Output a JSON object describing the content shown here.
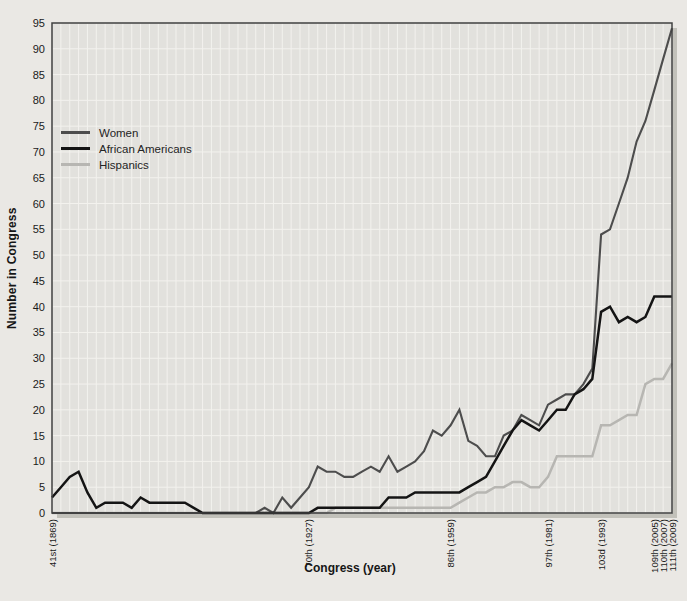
{
  "figure": {
    "y_axis_title": "Number in Congress",
    "x_axis_title": "Congress (year)"
  },
  "legend": {
    "position": "upper-left-inside",
    "items": [
      {
        "label": "Women",
        "color": "#4d4d4d"
      },
      {
        "label": "African Americans",
        "color": "#141414"
      },
      {
        "label": "Hispanics",
        "color": "#b7b6b2"
      }
    ]
  },
  "colors": {
    "paper_background": "#eae8e4",
    "plot_background": "#e2e1dd",
    "gridline": "#f3f2ee",
    "frame": "#3f3f3f",
    "shadow": "#c2c1ba",
    "tick_text": "#1a1a1a"
  },
  "chart_data": {
    "type": "line",
    "title": "",
    "xlabel": "Congress (year)",
    "ylabel": "Number in Congress",
    "grid": true,
    "legend_position": "upper-left-inside",
    "ylim": [
      0,
      95
    ],
    "y_tick_step": 5,
    "y_ticks": [
      0,
      5,
      10,
      15,
      20,
      25,
      30,
      35,
      40,
      45,
      50,
      55,
      60,
      65,
      70,
      75,
      80,
      85,
      90,
      95
    ],
    "x_unit": "Congress number (one data point per Congress)",
    "x_range": [
      41,
      111
    ],
    "x_step": 1,
    "x": [
      41,
      42,
      43,
      44,
      45,
      46,
      47,
      48,
      49,
      50,
      51,
      52,
      53,
      54,
      55,
      56,
      57,
      58,
      59,
      60,
      61,
      62,
      63,
      64,
      65,
      66,
      67,
      68,
      69,
      70,
      71,
      72,
      73,
      74,
      75,
      76,
      77,
      78,
      79,
      80,
      81,
      82,
      83,
      84,
      85,
      86,
      87,
      88,
      89,
      90,
      91,
      92,
      93,
      94,
      95,
      96,
      97,
      98,
      99,
      100,
      101,
      102,
      103,
      104,
      105,
      106,
      107,
      108,
      109,
      110,
      111
    ],
    "x_tick_labels": [
      {
        "congress": 41,
        "label": "41st (1869)"
      },
      {
        "congress": 70,
        "label": "70th (1927)"
      },
      {
        "congress": 86,
        "label": "86th (1959)"
      },
      {
        "congress": 97,
        "label": "97th (1981)"
      },
      {
        "congress": 103,
        "label": "103d (1993)"
      },
      {
        "congress": 109,
        "label": "109th (2005)"
      },
      {
        "congress": 110,
        "label": "110th (2007)"
      },
      {
        "congress": 111,
        "label": "111th (2009)"
      }
    ],
    "series": [
      {
        "name": "Women",
        "color": "#4d4d4d",
        "stroke_width": 2.1,
        "values": [
          0,
          0,
          0,
          0,
          0,
          0,
          0,
          0,
          0,
          0,
          0,
          0,
          0,
          0,
          0,
          0,
          0,
          0,
          0,
          0,
          0,
          0,
          0,
          0,
          1,
          0,
          3,
          1,
          3,
          5,
          9,
          8,
          8,
          7,
          7,
          8,
          9,
          8,
          11,
          8,
          9,
          10,
          12,
          16,
          15,
          17,
          20,
          14,
          13,
          11,
          11,
          15,
          16,
          19,
          18,
          17,
          21,
          22,
          23,
          23,
          25,
          28,
          54,
          55,
          60,
          65,
          72,
          76,
          82,
          88,
          94
        ]
      },
      {
        "name": "African Americans",
        "color": "#141414",
        "stroke_width": 2.5,
        "values": [
          3,
          5,
          7,
          8,
          4,
          1,
          2,
          2,
          2,
          1,
          3,
          2,
          2,
          2,
          2,
          2,
          1,
          0,
          0,
          0,
          0,
          0,
          0,
          0,
          0,
          0,
          0,
          0,
          0,
          0,
          1,
          1,
          1,
          1,
          1,
          1,
          1,
          1,
          3,
          3,
          3,
          4,
          4,
          4,
          4,
          4,
          4,
          5,
          6,
          7,
          10,
          13,
          16,
          18,
          17,
          16,
          18,
          20,
          20,
          23,
          24,
          26,
          39,
          40,
          37,
          38,
          37,
          38,
          42,
          42,
          42
        ]
      },
      {
        "name": "Hispanics",
        "color": "#b7b6b2",
        "stroke_width": 2.5,
        "values": [
          0,
          0,
          0,
          0,
          0,
          0,
          0,
          0,
          0,
          0,
          0,
          0,
          0,
          0,
          0,
          0,
          0,
          0,
          0,
          0,
          0,
          0,
          0,
          0,
          0,
          0,
          0,
          0,
          0,
          0,
          0,
          0,
          1,
          1,
          1,
          1,
          1,
          1,
          1,
          1,
          1,
          1,
          1,
          1,
          1,
          1,
          2,
          3,
          4,
          4,
          5,
          5,
          6,
          6,
          5,
          5,
          7,
          11,
          11,
          11,
          11,
          11,
          17,
          17,
          18,
          19,
          19,
          25,
          26,
          26,
          29
        ]
      }
    ]
  }
}
